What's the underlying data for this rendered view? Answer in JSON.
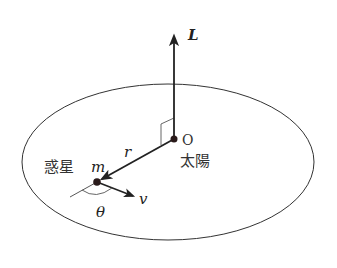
{
  "diagram": {
    "type": "physics-orbit",
    "colors": {
      "line": "#333333",
      "background": "#ffffff",
      "dot": "#2a1a1a"
    },
    "labels": {
      "angular_momentum": "L",
      "origin": "O",
      "sun": "太陽",
      "planet": "惑星",
      "mass": "m",
      "radius": "r",
      "velocity": "v",
      "angle": "θ"
    },
    "elements": {
      "orbit": {
        "shape": "ellipse",
        "cx": 168,
        "cy": 162,
        "rx": 146,
        "ry": 78
      },
      "sun": {
        "x": 174,
        "y": 139
      },
      "planet": {
        "x": 97,
        "y": 182
      },
      "L_vector": {
        "from": [
          174,
          139
        ],
        "to": [
          174,
          34
        ]
      },
      "r_vector": {
        "from": [
          174,
          139
        ],
        "to": [
          102,
          180
        ]
      },
      "v_vector": {
        "from": [
          97,
          182
        ],
        "to": [
          134,
          197
        ]
      }
    }
  }
}
